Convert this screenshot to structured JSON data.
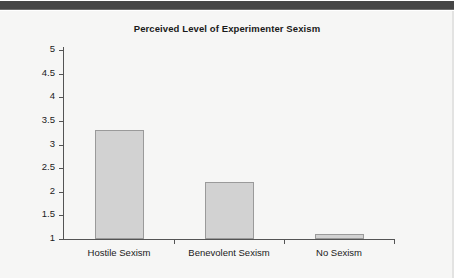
{
  "page": {
    "background_color": "#f6f6f5",
    "top_band_color": "#464646"
  },
  "chart_data": {
    "type": "bar",
    "title": "Perceived Level of Experimenter Sexism",
    "xlabel": "",
    "ylabel": "",
    "categories": [
      "Hostile Sexism",
      "Benevolent Sexism",
      "No Sexism"
    ],
    "values": [
      3.3,
      2.2,
      1.1
    ],
    "ylim": [
      1,
      5
    ],
    "ytick_labels": [
      "5",
      "4.5",
      "4",
      "3.5",
      "3",
      "2.5",
      "2",
      "1.5",
      "1"
    ],
    "ytick_values": [
      5,
      4.5,
      4,
      3.5,
      3,
      2.5,
      2,
      1.5,
      1
    ],
    "grid": false,
    "legend": null,
    "bar_fill_color": "#d2d2d2",
    "bar_edge_color": "#9a9a9a",
    "axis_color": "#545454",
    "text_color": "#1a1a1a"
  }
}
